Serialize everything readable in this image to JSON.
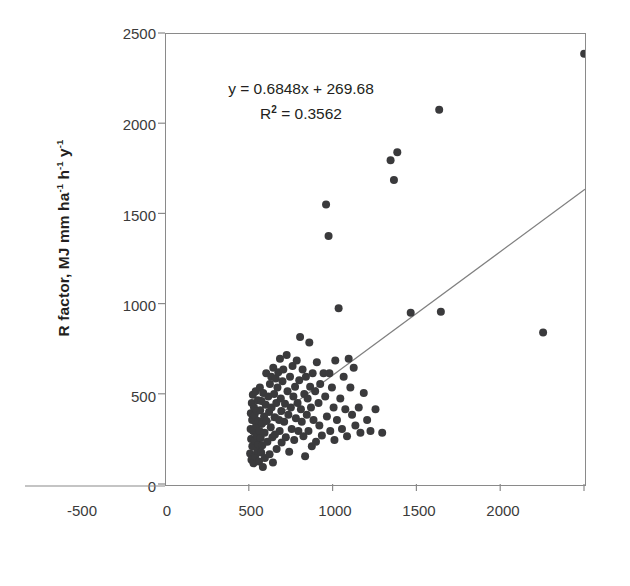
{
  "chart_data": {
    "type": "scatter",
    "title": "",
    "xlabel": "Altitude, m",
    "ylabel": "R factor, MJ mm ha-1 h-1 y-1",
    "ylabel_parts": [
      "R factor, MJ mm ha",
      "-1",
      " h",
      "-1",
      " y",
      "-1"
    ],
    "xlim": [
      -500,
      2000
    ],
    "xticks": [
      -500,
      0,
      500,
      1000,
      1500,
      2000
    ],
    "yticks": [
      0,
      500,
      1000,
      1500,
      2000,
      2500
    ],
    "ylim": [
      0,
      2500
    ],
    "grid": false,
    "legend": "none",
    "marker_color": "#3a3a3c",
    "trendline_color": "#808080",
    "frame_color": "#8a8a8a",
    "annotation": {
      "equation": "y = 0.6848x + 269.68",
      "r_squared_prefix": "R",
      "r_squared_sup": "2",
      "r_squared_value": " = 0.3562",
      "slope": 0.6848,
      "intercept": 269.68,
      "r2": 0.3562
    },
    "trendline": {
      "x_start": 0,
      "y_start": 269.68,
      "x_end": 2000,
      "y_end": 1639.28
    },
    "points": [
      [
        2,
        175
      ],
      [
        5,
        310
      ],
      [
        6,
        398
      ],
      [
        8,
        255
      ],
      [
        10,
        140
      ],
      [
        12,
        455
      ],
      [
        14,
        360
      ],
      [
        15,
        215
      ],
      [
        18,
        500
      ],
      [
        20,
        300
      ],
      [
        22,
        120
      ],
      [
        25,
        430
      ],
      [
        28,
        385
      ],
      [
        30,
        245
      ],
      [
        32,
        160
      ],
      [
        35,
        520
      ],
      [
        38,
        330
      ],
      [
        40,
        275
      ],
      [
        42,
        410
      ],
      [
        45,
        190
      ],
      [
        48,
        470
      ],
      [
        50,
        355
      ],
      [
        52,
        225
      ],
      [
        55,
        130
      ],
      [
        58,
        300
      ],
      [
        60,
        540
      ],
      [
        62,
        415
      ],
      [
        65,
        260
      ],
      [
        68,
        180
      ],
      [
        70,
        465
      ],
      [
        72,
        340
      ],
      [
        75,
        220
      ],
      [
        78,
        100
      ],
      [
        80,
        510
      ],
      [
        85,
        380
      ],
      [
        88,
        290
      ],
      [
        90,
        150
      ],
      [
        95,
        445
      ],
      [
        98,
        620
      ],
      [
        100,
        355
      ],
      [
        105,
        240
      ],
      [
        110,
        490
      ],
      [
        115,
        405
      ],
      [
        118,
        170
      ],
      [
        120,
        560
      ],
      [
        125,
        320
      ],
      [
        128,
        600
      ],
      [
        130,
        430
      ],
      [
        135,
        265
      ],
      [
        138,
        125
      ],
      [
        140,
        650
      ],
      [
        145,
        505
      ],
      [
        148,
        375
      ],
      [
        150,
        280
      ],
      [
        155,
        590
      ],
      [
        158,
        455
      ],
      [
        160,
        200
      ],
      [
        165,
        540
      ],
      [
        170,
        625
      ],
      [
        175,
        360
      ],
      [
        178,
        300
      ],
      [
        180,
        700
      ],
      [
        185,
        480
      ],
      [
        188,
        410
      ],
      [
        190,
        235
      ],
      [
        195,
        575
      ],
      [
        200,
        640
      ],
      [
        205,
        350
      ],
      [
        210,
        450
      ],
      [
        215,
        265
      ],
      [
        220,
        720
      ],
      [
        225,
        520
      ],
      [
        230,
        390
      ],
      [
        235,
        185
      ],
      [
        240,
        600
      ],
      [
        245,
        430
      ],
      [
        250,
        310
      ],
      [
        255,
        660
      ],
      [
        260,
        490
      ],
      [
        265,
        250
      ],
      [
        270,
        545
      ],
      [
        275,
        370
      ],
      [
        280,
        690
      ],
      [
        285,
        455
      ],
      [
        290,
        300
      ],
      [
        295,
        580
      ],
      [
        300,
        820
      ],
      [
        305,
        420
      ],
      [
        310,
        350
      ],
      [
        315,
        640
      ],
      [
        320,
        270
      ],
      [
        325,
        505
      ],
      [
        330,
        160
      ],
      [
        335,
        600
      ],
      [
        340,
        390
      ],
      [
        345,
        480
      ],
      [
        350,
        300
      ],
      [
        355,
        790
      ],
      [
        360,
        545
      ],
      [
        365,
        430
      ],
      [
        370,
        215
      ],
      [
        375,
        620
      ],
      [
        380,
        360
      ],
      [
        390,
        520
      ],
      [
        395,
        240
      ],
      [
        400,
        680
      ],
      [
        410,
        455
      ],
      [
        415,
        330
      ],
      [
        420,
        560
      ],
      [
        430,
        275
      ],
      [
        440,
        620
      ],
      [
        450,
        490
      ],
      [
        455,
        1555
      ],
      [
        460,
        380
      ],
      [
        470,
        1380
      ],
      [
        475,
        620
      ],
      [
        480,
        300
      ],
      [
        490,
        540
      ],
      [
        500,
        430
      ],
      [
        505,
        250
      ],
      [
        510,
        690
      ],
      [
        520,
        360
      ],
      [
        530,
        980
      ],
      [
        540,
        480
      ],
      [
        550,
        310
      ],
      [
        560,
        600
      ],
      [
        570,
        420
      ],
      [
        580,
        270
      ],
      [
        590,
        700
      ],
      [
        600,
        540
      ],
      [
        610,
        390
      ],
      [
        620,
        650
      ],
      [
        630,
        330
      ],
      [
        650,
        430
      ],
      [
        660,
        290
      ],
      [
        680,
        510
      ],
      [
        700,
        360
      ],
      [
        720,
        300
      ],
      [
        750,
        420
      ],
      [
        790,
        290
      ],
      [
        840,
        1800
      ],
      [
        860,
        1690
      ],
      [
        880,
        1845
      ],
      [
        960,
        955
      ],
      [
        1130,
        2080
      ],
      [
        1140,
        960
      ],
      [
        1750,
        845
      ],
      [
        1995,
        2390
      ]
    ]
  }
}
